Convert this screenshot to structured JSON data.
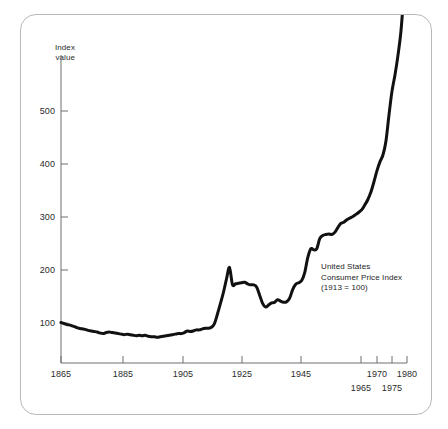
{
  "figure": {
    "frame_color": "#b9b9b9",
    "background": "#ffffff"
  },
  "annotation": {
    "line1": "United States",
    "line2": "Consumer Price Index",
    "line3": "(1913 = 100)"
  },
  "axis": {
    "y_title_line1": "Index",
    "y_title_line2": "value",
    "y_ticks": [
      "100",
      "200",
      "300",
      "400",
      "500"
    ],
    "x_ticks_major": [
      "1865",
      "1885",
      "1905",
      "1925",
      "1945"
    ],
    "x_ticks_upper_minor": [
      "1970",
      "1980"
    ],
    "x_ticks_lower_minor": [
      "1965",
      "1975"
    ]
  },
  "chart_data": {
    "type": "line",
    "title": "United States Consumer Price Index (1913 = 100)",
    "subtitle": "",
    "xlabel": "",
    "ylabel": "Index value",
    "xlim": [
      1865,
      1980
    ],
    "ylim": [
      0,
      580
    ],
    "yticks": [
      100,
      200,
      300,
      400,
      500
    ],
    "xticks": [
      1865,
      1885,
      1905,
      1925,
      1945,
      1965,
      1970,
      1975,
      1980
    ],
    "grid": false,
    "legend": null,
    "line_color": "#111111",
    "line_width": 3,
    "base_year": 1913,
    "base_value": 100,
    "x": [
      1865,
      1866,
      1867,
      1868,
      1869,
      1870,
      1871,
      1872,
      1873,
      1874,
      1875,
      1876,
      1877,
      1878,
      1879,
      1880,
      1881,
      1882,
      1883,
      1884,
      1885,
      1886,
      1887,
      1888,
      1889,
      1890,
      1891,
      1892,
      1893,
      1894,
      1895,
      1896,
      1897,
      1898,
      1899,
      1900,
      1901,
      1902,
      1903,
      1904,
      1905,
      1906,
      1907,
      1908,
      1909,
      1910,
      1911,
      1912,
      1913,
      1914,
      1915,
      1916,
      1917,
      1918,
      1919,
      1920,
      1921,
      1922,
      1923,
      1924,
      1925,
      1926,
      1927,
      1928,
      1929,
      1930,
      1931,
      1932,
      1933,
      1934,
      1935,
      1936,
      1937,
      1938,
      1939,
      1940,
      1941,
      1942,
      1943,
      1944,
      1945,
      1946,
      1947,
      1948,
      1949,
      1950,
      1951,
      1952,
      1953,
      1954,
      1955,
      1956,
      1957,
      1958,
      1959,
      1960,
      1961,
      1962,
      1963,
      1964,
      1965,
      1966,
      1967,
      1968,
      1969,
      1970,
      1971,
      1972,
      1973,
      1974,
      1975,
      1976,
      1977,
      1978,
      1979,
      1980
    ],
    "y": [
      101,
      99,
      97,
      96,
      94,
      92,
      90,
      89,
      88,
      86,
      85,
      84,
      83,
      81,
      80,
      82,
      83,
      82,
      81,
      80,
      79,
      78,
      79,
      78,
      77,
      76,
      77,
      76,
      77,
      75,
      74,
      74,
      73,
      74,
      75,
      76,
      77,
      78,
      79,
      80,
      80,
      82,
      85,
      84,
      85,
      87,
      87,
      89,
      90,
      90,
      92,
      99,
      117,
      137,
      158,
      183,
      205,
      172,
      174,
      175,
      176,
      177,
      174,
      172,
      172,
      168,
      153,
      137,
      130,
      134,
      138,
      139,
      144,
      141,
      139,
      140,
      147,
      163,
      173,
      176,
      180,
      195,
      223,
      240,
      238,
      240,
      259,
      265,
      267,
      268,
      267,
      271,
      280,
      288,
      290,
      295,
      298,
      301,
      305,
      309,
      314,
      323,
      333,
      347,
      366,
      387,
      404,
      417,
      443,
      492,
      537,
      568,
      605,
      651,
      725,
      800
    ],
    "series_note": "Values read from the plotted curve; index base 1913 = 100",
    "annotations": [
      {
        "text": "United States",
        "x": 1955,
        "y": 205
      },
      {
        "text": "Consumer Price Index",
        "x": 1955,
        "y": 190
      },
      {
        "text": "(1913 = 100)",
        "x": 1955,
        "y": 175
      }
    ]
  }
}
